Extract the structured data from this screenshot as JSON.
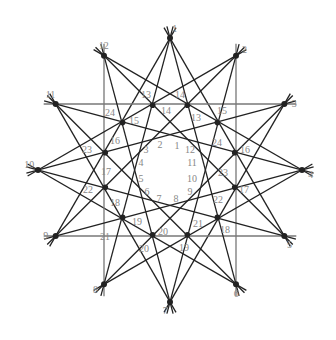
{
  "diagram": {
    "title": "",
    "type": "star polygon {12/4} and {12/5} line arrangement",
    "center": [
      170,
      170
    ],
    "outer_radius": 132,
    "inner_radius": 67,
    "colors": {
      "line": "#222222",
      "label": "#888888",
      "background": "#ffffff"
    },
    "outer_points": [
      {
        "label": "1"
      },
      {
        "label": "2"
      },
      {
        "label": "3"
      },
      {
        "label": "4"
      },
      {
        "label": "5"
      },
      {
        "label": "6"
      },
      {
        "label": "7"
      },
      {
        "label": "8"
      },
      {
        "label": "9"
      },
      {
        "label": "10"
      },
      {
        "label": "11"
      },
      {
        "label": "12"
      }
    ],
    "inner_point_labels": [
      {
        "label": "13",
        "x": 146,
        "y": 98
      },
      {
        "label": "14",
        "x": 180,
        "y": 98
      },
      {
        "label": "13",
        "x": 196,
        "y": 121
      },
      {
        "label": "14",
        "x": 166,
        "y": 114
      },
      {
        "label": "15",
        "x": 222,
        "y": 114
      },
      {
        "label": "16",
        "x": 245,
        "y": 153
      },
      {
        "label": "24",
        "x": 217,
        "y": 146
      },
      {
        "label": "15",
        "x": 134,
        "y": 124
      },
      {
        "label": "24",
        "x": 110,
        "y": 116
      },
      {
        "label": "16",
        "x": 115,
        "y": 144
      },
      {
        "label": "23",
        "x": 87,
        "y": 153
      },
      {
        "label": "17",
        "x": 106,
        "y": 175
      },
      {
        "label": "22",
        "x": 88,
        "y": 193
      },
      {
        "label": "18",
        "x": 115,
        "y": 206
      },
      {
        "label": "21",
        "x": 105,
        "y": 240
      },
      {
        "label": "19",
        "x": 137,
        "y": 225
      },
      {
        "label": "20",
        "x": 144,
        "y": 252
      },
      {
        "label": "20",
        "x": 163,
        "y": 235
      },
      {
        "label": "19",
        "x": 184,
        "y": 251
      },
      {
        "label": "21",
        "x": 198,
        "y": 227
      },
      {
        "label": "18",
        "x": 225,
        "y": 233
      },
      {
        "label": "22",
        "x": 218,
        "y": 203
      },
      {
        "label": "17",
        "x": 244,
        "y": 193
      },
      {
        "label": "23",
        "x": 223,
        "y": 176
      }
    ],
    "inner_ring_labels": [
      {
        "label": "1",
        "x": 177,
        "y": 149
      },
      {
        "label": "2",
        "x": 160,
        "y": 148
      },
      {
        "label": "3",
        "x": 146,
        "y": 153
      },
      {
        "label": "4",
        "x": 141,
        "y": 166
      },
      {
        "label": "5",
        "x": 141,
        "y": 182
      },
      {
        "label": "6",
        "x": 147,
        "y": 195
      },
      {
        "label": "7",
        "x": 159,
        "y": 202
      },
      {
        "label": "8",
        "x": 176,
        "y": 202
      },
      {
        "label": "9",
        "x": 190,
        "y": 195
      },
      {
        "label": "10",
        "x": 192,
        "y": 182
      },
      {
        "label": "11",
        "x": 192,
        "y": 166
      },
      {
        "label": "12",
        "x": 190,
        "y": 153
      }
    ]
  }
}
